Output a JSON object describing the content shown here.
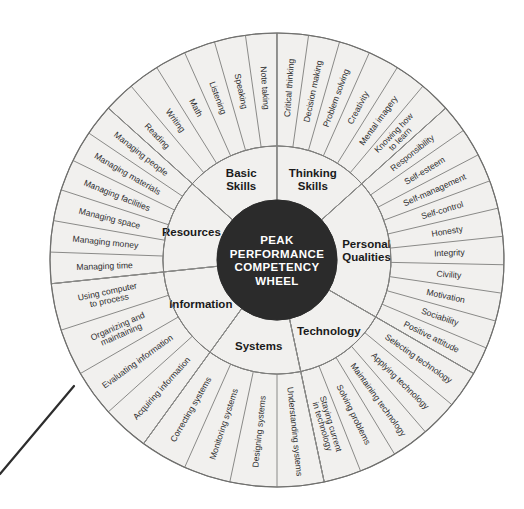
{
  "diagram": {
    "hub": {
      "lines": [
        "PEAK",
        "PERFORMANCE",
        "COMPETENCY",
        "WHEEL"
      ],
      "fill_color": "#2b2b2b",
      "text_color": "#ffffff"
    },
    "ring_fill_color": "#f1f0ee",
    "ring_stroke_color": "#7a7a78",
    "background_color": "#ffffff",
    "center": {
      "x": 277,
      "y": 260
    },
    "radii": {
      "hub": 60,
      "inner_ring_outer": 114,
      "outer_ring_outer": 227
    },
    "sectors": [
      {
        "name": "basic-skills",
        "category": "Basic\nSkills",
        "category_lines": [
          "Basic",
          "Skills"
        ],
        "start_angle": -90,
        "end_angle": -38,
        "skills": [
          "Reading",
          "Writing",
          "Math",
          "Listening",
          "Speaking",
          "Note taking"
        ]
      },
      {
        "name": "thinking-skills",
        "category": "Thinking\nSkills",
        "category_lines": [
          "Thinking",
          "Skills"
        ],
        "start_angle": -90,
        "end_angle": -38,
        "skills": [
          "Critical thinking",
          "Decision making",
          "Problem solving",
          "Creativity",
          "Mental imagery",
          "Knowing how to learn"
        ]
      },
      {
        "name": "personal-qualities",
        "category": "Personal\nQualities",
        "category_lines": [
          "Personal",
          "Qualities"
        ],
        "start_angle": -38,
        "end_angle": 38,
        "skills": [
          "Responsibility",
          "Self-esteem",
          "Self-management",
          "Self-control",
          "Honesty",
          "Integrity",
          "Civility",
          "Motivation",
          "Sociability",
          "Positive attitude"
        ]
      },
      {
        "name": "technology",
        "category": "Technology",
        "category_lines": [
          "Technology"
        ],
        "start_angle": 38,
        "end_angle": 90,
        "skills": [
          "Selecting technology",
          "Applying technology",
          "Maintaining technology",
          "Solving problems",
          "Staying current in technology"
        ]
      },
      {
        "name": "systems",
        "category": "Systems",
        "category_lines": [
          "Systems"
        ],
        "start_angle": 64,
        "end_angle": 116,
        "skills": [
          "Understanding systems",
          "Designing systems",
          "Monitoring systems",
          "Correcting systems"
        ]
      },
      {
        "name": "information",
        "category": "Information",
        "category_lines": [
          "Information"
        ],
        "start_angle": 116,
        "end_angle": 168,
        "skills": [
          "Acquiring information",
          "Evaluating information",
          "Organizing and maintaining",
          "Using computer to process"
        ]
      },
      {
        "name": "resources",
        "category": "Resources",
        "category_lines": [
          "Resources"
        ],
        "start_angle": 168,
        "end_angle": 232,
        "skills": [
          "Managing time",
          "Managing money",
          "Managing space",
          "Managing facilities",
          "Managing materials",
          "Managing people"
        ]
      }
    ],
    "stray_line": {
      "x1": 0,
      "y1": 474,
      "x2": 74,
      "y2": 386,
      "color": "#2d2d2d"
    }
  }
}
